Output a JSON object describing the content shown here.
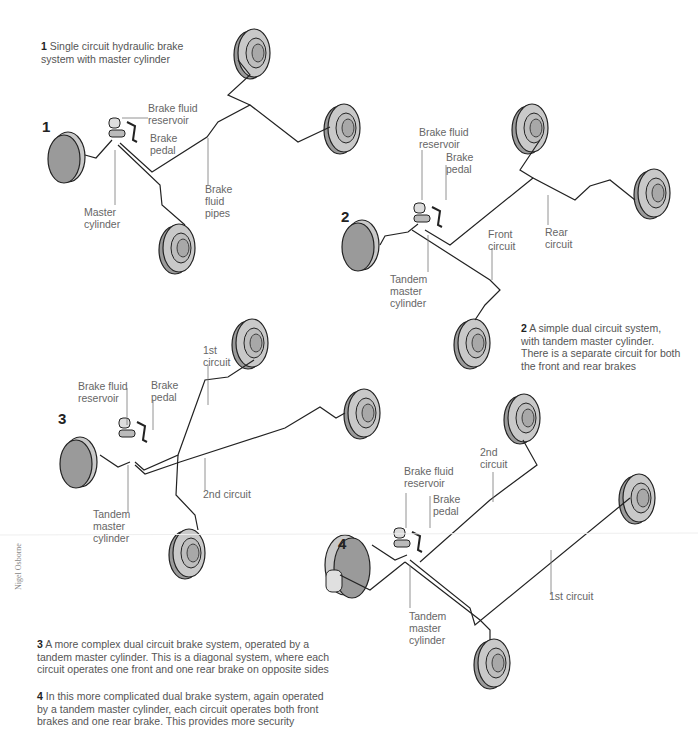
{
  "diagrams": [
    {
      "number": "1",
      "caption_num": "1",
      "caption": "Single circuit hydraulic brake system with master cylinder",
      "labels": {
        "reservoir": "Brake fluid\nreservoir",
        "pedal": "Brake\npedal",
        "pipes": "Brake\nfluid\npipes",
        "cylinder": "Master\ncylinder"
      }
    },
    {
      "number": "2",
      "caption_num": "2",
      "caption": "A simple dual circuit system, with tandem master cylinder. There is a separate circuit for both the front and rear brakes",
      "labels": {
        "reservoir": "Brake fluid\nreservoir",
        "pedal": "Brake\npedal",
        "front": "Front\ncircuit",
        "rear": "Rear\ncircuit",
        "cylinder": "Tandem\nmaster\ncylinder"
      }
    },
    {
      "number": "3",
      "caption_num": "3",
      "caption": "A more complex dual circuit brake system, operated by a tandem master cylinder. This is a diagonal system, where each circuit operates one front and one rear brake on opposite sides",
      "labels": {
        "reservoir": "Brake fluid\nreservoir",
        "pedal": "Brake\npedal",
        "first": "1st\ncircuit",
        "second": "2nd circuit",
        "cylinder": "Tandem\nmaster\ncylinder"
      }
    },
    {
      "number": "4",
      "caption_num": "4",
      "caption": "In this more complicated dual brake system, again operated by a tandem master cylinder, each circuit operates both front brakes and one rear brake. This provides more security",
      "labels": {
        "reservoir": "Brake fluid\nreservoir",
        "pedal": "Brake\npedal",
        "second": "2nd\ncircuit",
        "first": "1st circuit",
        "cylinder": "Tandem\nmaster\ncylinder"
      }
    }
  ],
  "credit": "Nigel Osborne",
  "colors": {
    "wheel_face": "#9e9e9e",
    "wheel_rim": "#c8c8c8",
    "pipe": "#222222",
    "leader": "#777777"
  }
}
